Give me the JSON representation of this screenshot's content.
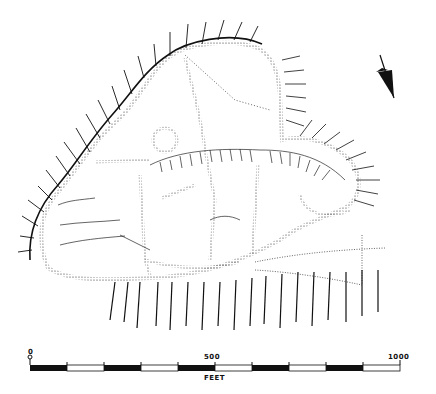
{
  "map": {
    "type": "hachured archaeological site plan",
    "ink_color": "#111111",
    "background": "#ffffff",
    "north_arrow": {
      "icon": "north-arrow-icon"
    },
    "scale_bar": {
      "labels": [
        "0",
        "500",
        "1000"
      ],
      "unit": "FEET",
      "segments": 10,
      "pattern": [
        "black",
        "white",
        "black",
        "white",
        "black",
        "white",
        "black",
        "white",
        "black",
        "white"
      ]
    }
  }
}
